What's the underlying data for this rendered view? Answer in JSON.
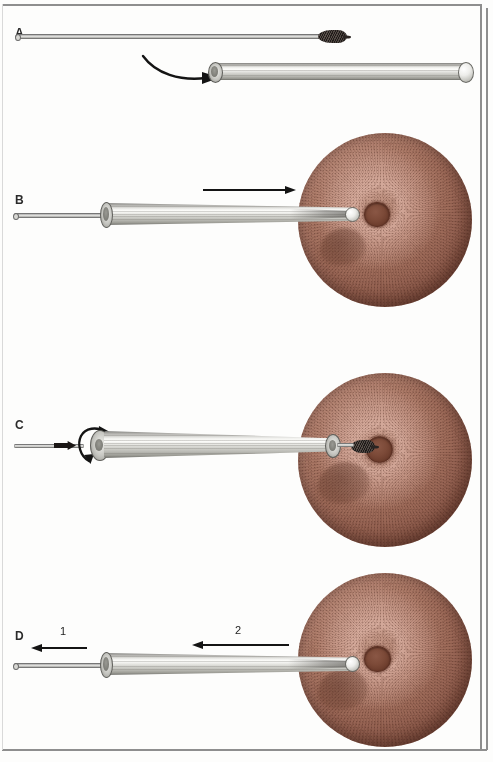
{
  "figure": {
    "frame_color": "#8e8e8e",
    "background_color": "#fdfdfc"
  },
  "palette": {
    "bristle_dark": "#2a2422",
    "metal_light": "#f1f1ee",
    "metal_mid": "#bcbcb6",
    "metal_dark": "#6d6d68",
    "mucosa_highlight": "#c59a8a",
    "mucosa_mid": "#9c6a59",
    "mucosa_dark": "#66392d",
    "os_dark": "#6a3b2b",
    "arrow_black": "#141414",
    "label_black": "#2b2b2b"
  },
  "panels": [
    {
      "id": "panel-a",
      "label": "A",
      "caption_visible": false,
      "elements": {
        "brush_label": "cytology brush with bristled tip",
        "sheath_label": "outer protective sheath",
        "arrow_label": "curved insertion arrow"
      }
    },
    {
      "id": "panel-b",
      "label": "B",
      "elements": {
        "assembly_label": "brush retracted inside sheath",
        "arrow_label": "advance sheath toward opening",
        "anatomy_label": "mucosal surface with central opening"
      }
    },
    {
      "id": "panel-c",
      "label": "C",
      "elements": {
        "arrow_label": "rotate brush to collect specimen",
        "marker_label": "advance brush out of sheath",
        "anatomy_label": "mucosal surface with central opening"
      }
    },
    {
      "id": "panel-d",
      "label": "D",
      "step_numbers": [
        "1",
        "2"
      ],
      "elements": {
        "step1_label": "withdraw brush into sheath",
        "step2_label": "withdraw sheath from opening",
        "anatomy_label": "mucosal surface with central opening"
      }
    }
  ]
}
